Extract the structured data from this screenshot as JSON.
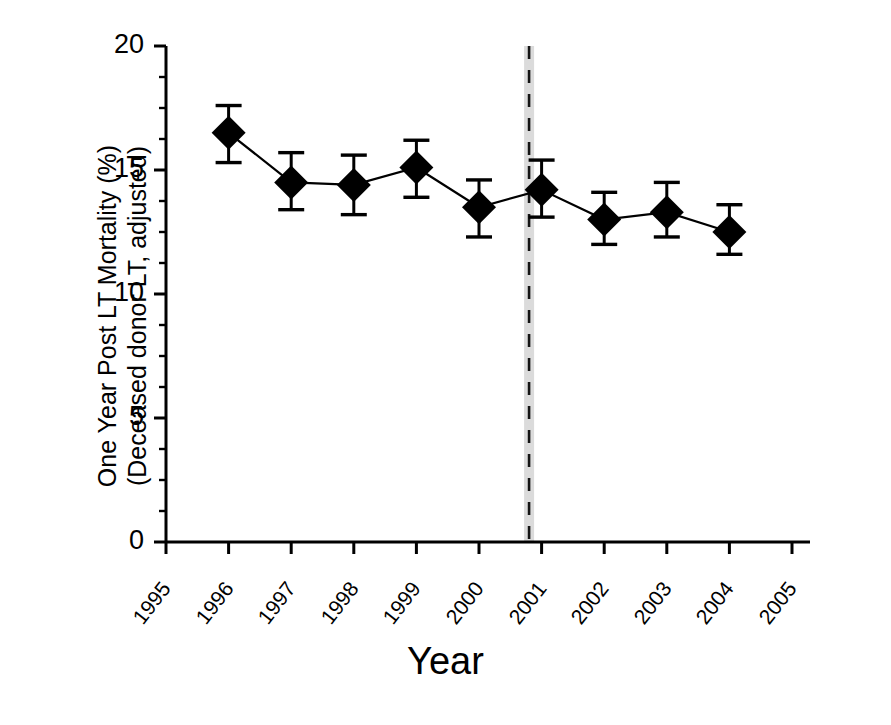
{
  "chart_data": {
    "type": "line",
    "title": "",
    "xlabel": "Year",
    "ylabel": "One Year Post LT Mortality (%)",
    "ylabel_line2": "(Deceased donor LT, adjusted)",
    "xlim": [
      1995,
      2005
    ],
    "ylim": [
      0,
      20
    ],
    "y_ticks": [
      0,
      5,
      10,
      15,
      20
    ],
    "y_tick_labels": [
      "0",
      "5",
      "10",
      "15",
      "20"
    ],
    "y_minor_tick_step": 1.25,
    "x_ticks": [
      1995,
      1996,
      1997,
      1998,
      1999,
      2000,
      2001,
      2002,
      2003,
      2004,
      2005
    ],
    "x_tick_labels": [
      "1995",
      "1996",
      "1997",
      "1998",
      "1999",
      "2000",
      "2001",
      "2002",
      "2003",
      "2004",
      "2005"
    ],
    "grid": false,
    "legend": null,
    "marker": "diamond",
    "marker_color": "#000000",
    "line_color": "#000000",
    "errorbar_color": "#000000",
    "series": [
      {
        "name": "One Year Post LT Mortality (Deceased donor LT, adjusted)",
        "x": [
          1996,
          1997,
          1998,
          1999,
          2000,
          2001,
          2002,
          2003,
          2004
        ],
        "values": [
          16.5,
          14.5,
          14.4,
          15.1,
          13.5,
          14.2,
          13.0,
          13.3,
          12.5
        ],
        "err_low": [
          15.3,
          13.4,
          13.2,
          13.9,
          12.3,
          13.1,
          12.0,
          12.3,
          11.6
        ],
        "err_high": [
          17.6,
          15.7,
          15.6,
          16.2,
          14.6,
          15.4,
          14.1,
          14.5,
          13.6
        ]
      }
    ],
    "annotations": [
      {
        "type": "vertical-line",
        "name": "policy-change-marker",
        "x": 2000.8,
        "y_from": 0,
        "y_to": 20,
        "style": "dashed-over-gray-band",
        "band_color": "#bdbdbd",
        "dash_color": "#000000"
      }
    ]
  }
}
